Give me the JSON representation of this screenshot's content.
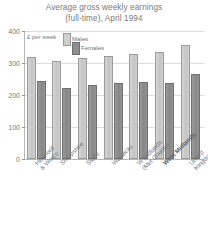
{
  "chart_data": {
    "type": "bar",
    "title": "Average gross weekly earnings\n(full-time), April 1994",
    "title_line1": "Average gross weekly earnings",
    "title_line2": "(full-t me), April 1994",
    "unit_label": "£ per week",
    "xlabel": "",
    "ylabel": "",
    "ylim": [
      0,
      400
    ],
    "yticks": [
      0,
      100,
      200,
      300,
      400
    ],
    "ytick_labels": [
      "0",
      "100",
      "200",
      "300",
      "400"
    ],
    "grid": true,
    "legend_position": "top-left-inside",
    "categories": [
      "Hereford\n& Worcs",
      "Shropshire",
      "Staffs",
      "Warwicks",
      "W Midlands\n(Met County)",
      "West Midlands",
      "United Kingdom"
    ],
    "categories_bold": [
      false,
      false,
      false,
      false,
      false,
      true,
      false
    ],
    "series": [
      {
        "name": "Males",
        "color": "#cfcfcf",
        "values": [
          318,
          307,
          317,
          323,
          327,
          335,
          356
        ]
      },
      {
        "name": "Females",
        "color": "#8f8f8f",
        "values": [
          245,
          222,
          230,
          238,
          241,
          238,
          266
        ]
      }
    ]
  }
}
